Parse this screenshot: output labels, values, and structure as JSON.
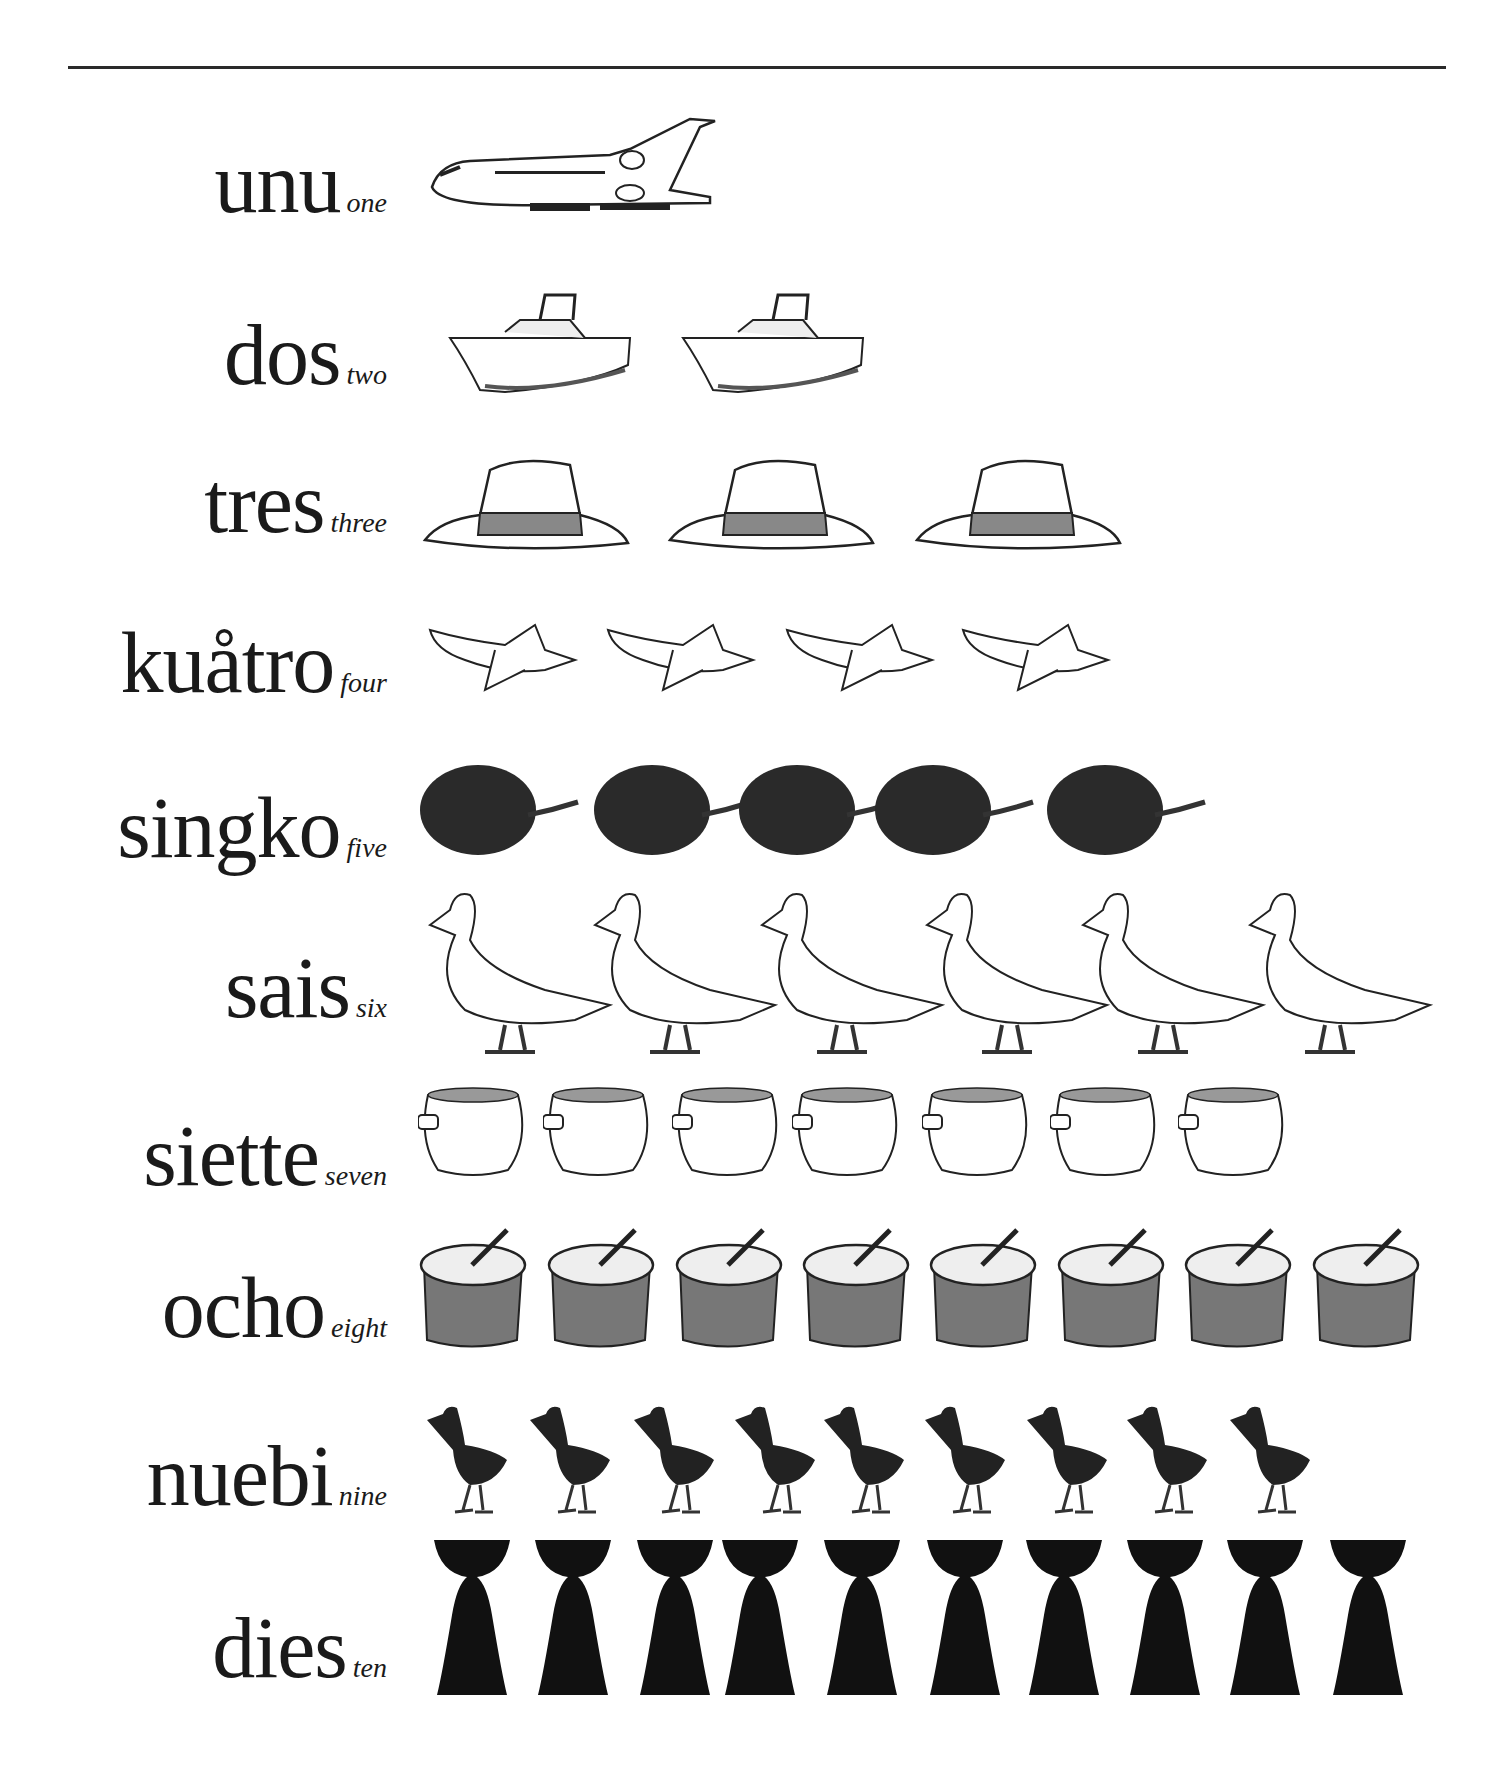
{
  "page": {
    "rule": true
  },
  "rows": [
    {
      "word": "unu",
      "english": "one",
      "count": 1,
      "icon": "airplane-icon"
    },
    {
      "word": "dos",
      "english": "two",
      "count": 2,
      "icon": "boat-icon"
    },
    {
      "word": "tres",
      "english": "three",
      "count": 3,
      "icon": "hat-icon"
    },
    {
      "word": "kuåtro",
      "english": "four",
      "count": 4,
      "icon": "banana-icon"
    },
    {
      "word": "singko",
      "english": "five",
      "count": 5,
      "icon": "fruit-icon"
    },
    {
      "word": "sais",
      "english": "six",
      "count": 6,
      "icon": "duck-icon"
    },
    {
      "word": "siette",
      "english": "seven",
      "count": 7,
      "icon": "clay-pot-icon"
    },
    {
      "word": "ocho",
      "english": "eight",
      "count": 8,
      "icon": "cooking-pot-icon"
    },
    {
      "word": "nuebi",
      "english": "nine",
      "count": 9,
      "icon": "rail-bird-icon"
    },
    {
      "word": "dies",
      "english": "ten",
      "count": 10,
      "icon": "latte-stone-icon"
    }
  ]
}
